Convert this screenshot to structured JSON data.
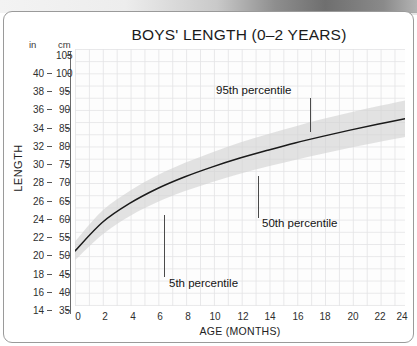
{
  "card": {
    "title": "BOYS' LENGTH (0–2 YEARS)"
  },
  "axes": {
    "y_title": "LENGTH",
    "x_title": "AGE (MONTHS)",
    "unit_left": "in",
    "unit_right": "cm",
    "in_ticks": [
      "40",
      "38",
      "36",
      "34",
      "32",
      "30",
      "28",
      "26",
      "24",
      "22",
      "20",
      "18",
      "16",
      "14"
    ],
    "cm_ticks": [
      "105",
      "100",
      "95",
      "90",
      "85",
      "80",
      "75",
      "70",
      "65",
      "60",
      "55",
      "50",
      "45",
      "40",
      "35"
    ],
    "x_ticks": [
      "0",
      "2",
      "4",
      "6",
      "8",
      "10",
      "12",
      "14",
      "16",
      "18",
      "20",
      "22",
      "24"
    ]
  },
  "annotations": {
    "p95": "95th percentile",
    "p50": "50th percentile",
    "p5": "5th percentile"
  },
  "colors": {
    "band": "#d2d2d2",
    "curve": "#1a1a1a",
    "grid": "#e4e4e6",
    "card_border": "#9a9a9a",
    "text": "#1b1b1b"
  },
  "chart_data": {
    "type": "line",
    "title": "BOYS' LENGTH (0–2 YEARS)",
    "xlabel": "AGE (MONTHS)",
    "ylabel": "LENGTH",
    "x_unit": "months",
    "y_unit_primary": "cm",
    "y_unit_secondary": "in",
    "xlim": [
      0,
      24
    ],
    "ylim": [
      35,
      105
    ],
    "ylim_in": [
      14,
      41.3
    ],
    "grid": true,
    "legend": "annotated-inline",
    "x": [
      0,
      2,
      4,
      6,
      8,
      10,
      12,
      14,
      16,
      18,
      20,
      22,
      24
    ],
    "series": [
      {
        "name": "5th percentile",
        "values": [
          47.5,
          54.5,
          59.5,
          63.3,
          66.3,
          68.8,
          71.0,
          73.0,
          74.8,
          76.5,
          78.1,
          79.6,
          81.0
        ]
      },
      {
        "name": "50th percentile",
        "values": [
          50.0,
          57.8,
          63.0,
          67.0,
          70.2,
          72.9,
          75.3,
          77.4,
          79.4,
          81.2,
          82.9,
          84.5,
          86.0
        ]
      },
      {
        "name": "95th percentile",
        "values": [
          52.5,
          61.0,
          66.4,
          70.6,
          74.0,
          76.9,
          79.5,
          81.8,
          83.9,
          85.9,
          87.7,
          89.4,
          91.0
        ]
      }
    ],
    "band": {
      "lower_series": "5th percentile",
      "upper_series": "95th percentile",
      "shaded": true
    }
  }
}
